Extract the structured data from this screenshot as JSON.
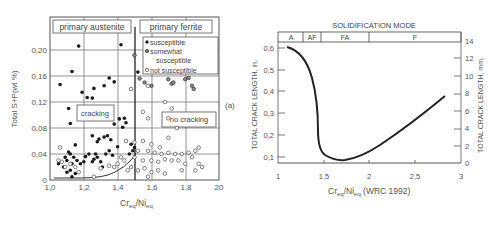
{
  "chart_data": [
    {
      "type": "scatter",
      "panel_label": "(a)",
      "title": "",
      "xlabel": "Cr_eq/Ni_eq",
      "ylabel": "Total S+P(wt %)",
      "xlim": [
        1.0,
        2.0
      ],
      "ylim": [
        0,
        0.24
      ],
      "x_ticks": [
        "1,0",
        "1,2",
        "1,4",
        "1,6",
        "1,8",
        "20"
      ],
      "y_ticks": [
        "0",
        "0,04",
        "0,08",
        "0,12",
        "0,16",
        "0,20"
      ],
      "grid": true,
      "regions": [
        {
          "label": "primary austenite"
        },
        {
          "label": "primary ferrite"
        },
        {
          "label": "cracking"
        },
        {
          "label": "no cracking"
        }
      ],
      "boundary_x": 1.5,
      "legend": {
        "position": "upper right",
        "entries": [
          "susceptible",
          "somewhat",
          "susceptible",
          "not susceptible"
        ]
      },
      "series": [
        {
          "name": "susceptible",
          "marker": "filled",
          "points": [
            [
              1.06,
              0.147
            ],
            [
              1.13,
              0.167
            ],
            [
              1.17,
              0.206
            ],
            [
              1.19,
              0.135
            ],
            [
              1.22,
              0.127
            ],
            [
              1.25,
              0.126
            ],
            [
              1.26,
              0.141
            ],
            [
              1.32,
              0.145
            ],
            [
              1.35,
              0.157
            ],
            [
              1.38,
              0.151
            ],
            [
              1.42,
              0.208
            ],
            [
              1.52,
              0.166
            ],
            [
              1.11,
              0.11
            ],
            [
              1.12,
              0.087
            ],
            [
              1.38,
              0.086
            ],
            [
              1.41,
              0.094
            ],
            [
              1.44,
              0.095
            ],
            [
              1.43,
              0.081
            ],
            [
              1.45,
              0.088
            ],
            [
              1.25,
              0.068
            ],
            [
              1.28,
              0.059
            ],
            [
              1.32,
              0.066
            ],
            [
              1.34,
              0.068
            ],
            [
              1.29,
              0.063
            ],
            [
              1.36,
              0.062
            ],
            [
              1.4,
              0.051
            ],
            [
              1.15,
              0.054
            ],
            [
              1.11,
              0.043
            ],
            [
              1.12,
              0.04
            ],
            [
              1.14,
              0.035
            ],
            [
              1.1,
              0.03
            ],
            [
              1.13,
              0.025
            ],
            [
              1.16,
              0.03
            ],
            [
              1.18,
              0.025
            ],
            [
              1.2,
              0.028
            ],
            [
              1.23,
              0.04
            ],
            [
              1.25,
              0.028
            ],
            [
              1.27,
              0.04
            ],
            [
              1.28,
              0.035
            ],
            [
              1.3,
              0.028
            ],
            [
              1.33,
              0.04
            ],
            [
              1.35,
              0.045
            ],
            [
              1.37,
              0.038
            ],
            [
              1.08,
              0.02
            ],
            [
              1.12,
              0.015
            ],
            [
              1.13,
              0.005
            ],
            [
              1.15,
              0.01
            ],
            [
              1.1,
              0.012
            ],
            [
              1.05,
              0.025
            ],
            [
              1.48,
              0.055
            ],
            [
              1.5,
              0.05
            ],
            [
              1.49,
              0.045
            ],
            [
              1.47,
              0.04
            ],
            [
              1.21,
              0.036
            ],
            [
              1.26,
              0.032
            ],
            [
              1.31,
              0.02
            ],
            [
              1.09,
              0.035
            ]
          ]
        },
        {
          "name": "somewhat susceptible",
          "marker": "half",
          "points": [
            [
              1.5,
              0.192
            ],
            [
              1.53,
              0.156
            ],
            [
              1.56,
              0.15
            ],
            [
              1.6,
              0.145
            ],
            [
              1.7,
              0.155
            ],
            [
              1.72,
              0.148
            ],
            [
              1.73,
              0.15
            ],
            [
              1.8,
              0.155
            ],
            [
              1.82,
              0.157
            ],
            [
              1.84,
              0.145
            ],
            [
              1.85,
              0.14
            ]
          ]
        },
        {
          "name": "not susceptible",
          "marker": "open",
          "points": [
            [
              1.48,
              0.14
            ],
            [
              1.58,
              0.145
            ],
            [
              1.68,
              0.12
            ],
            [
              1.72,
              0.11
            ],
            [
              1.55,
              0.105
            ],
            [
              1.58,
              0.095
            ],
            [
              1.7,
              0.095
            ],
            [
              1.75,
              0.08
            ],
            [
              1.7,
              0.065
            ],
            [
              1.45,
              0.06
            ],
            [
              1.5,
              0.058
            ],
            [
              1.55,
              0.06
            ],
            [
              1.6,
              0.055
            ],
            [
              1.65,
              0.05
            ],
            [
              1.52,
              0.045
            ],
            [
              1.58,
              0.045
            ],
            [
              1.62,
              0.042
            ],
            [
              1.66,
              0.04
            ],
            [
              1.7,
              0.042
            ],
            [
              1.74,
              0.04
            ],
            [
              1.78,
              0.04
            ],
            [
              1.82,
              0.042
            ],
            [
              1.86,
              0.045
            ],
            [
              1.88,
              0.05
            ],
            [
              1.5,
              0.035
            ],
            [
              1.55,
              0.03
            ],
            [
              1.6,
              0.03
            ],
            [
              1.64,
              0.028
            ],
            [
              1.68,
              0.032
            ],
            [
              1.72,
              0.03
            ],
            [
              1.76,
              0.03
            ],
            [
              1.8,
              0.025
            ],
            [
              1.84,
              0.035
            ],
            [
              1.88,
              0.025
            ],
            [
              1.9,
              0.02
            ],
            [
              1.48,
              0.02
            ],
            [
              1.52,
              0.015
            ],
            [
              1.56,
              0.018
            ],
            [
              1.6,
              0.012
            ],
            [
              1.64,
              0.015
            ],
            [
              1.68,
              0.01
            ],
            [
              1.78,
              0.015
            ],
            [
              1.86,
              0.015
            ],
            [
              1.44,
              0.03
            ],
            [
              1.4,
              0.025
            ],
            [
              1.38,
              0.02
            ],
            [
              1.35,
              0.022
            ],
            [
              1.3,
              0.018
            ],
            [
              1.06,
              0.05
            ],
            [
              1.05,
              0.03
            ],
            [
              1.07,
              0.028
            ],
            [
              1.09,
              0.02
            ],
            [
              1.12,
              0.025
            ],
            [
              1.15,
              0.02
            ],
            [
              1.17,
              0.012
            ],
            [
              1.26,
              0.005
            ],
            [
              1.46,
              0.015
            ],
            [
              1.42,
              0.035
            ],
            [
              1.58,
              0.005
            ]
          ]
        }
      ],
      "threshold_curve": [
        [
          1.02,
          0.005
        ],
        [
          1.2,
          0.006
        ],
        [
          1.3,
          0.01
        ],
        [
          1.4,
          0.02
        ],
        [
          1.46,
          0.03
        ],
        [
          1.5,
          0.04
        ]
      ]
    },
    {
      "type": "line",
      "title": "SOLIDIFICATION MODE",
      "xlabel": "Cr_eq/Ni_eq (WRC 1992)",
      "ylabel": "TOTAL CRACK LENGTH, in,",
      "y2label": "TOTAL CRACK LENGTH, mm,",
      "xlim": [
        1,
        3
      ],
      "ylim": [
        0.05,
        0.65
      ],
      "y2lim": [
        0,
        14
      ],
      "x_ticks": [
        "1",
        "1,5",
        "2",
        "2,5",
        "3"
      ],
      "y_ticks": [
        "0,1",
        "0,2",
        "0,3",
        "0,4",
        "0,5",
        "0,6"
      ],
      "y2_ticks": [
        "0",
        "2",
        "4",
        "6",
        "8",
        "10",
        "12",
        "14"
      ],
      "grid": false,
      "modes": [
        {
          "label": "A",
          "from": 1.0,
          "to": 1.28
        },
        {
          "label": "AF",
          "from": 1.28,
          "to": 1.48
        },
        {
          "label": "FA",
          "from": 1.48,
          "to": 2.05
        },
        {
          "label": "F",
          "from": 2.05,
          "to": 3.0
        }
      ],
      "series": [
        {
          "name": "crack length",
          "x": [
            1.1,
            1.2,
            1.3,
            1.38,
            1.43,
            1.45,
            1.46,
            1.5,
            1.6,
            1.7,
            1.8,
            2.0,
            2.2,
            2.4,
            2.6,
            2.82
          ],
          "values": [
            0.61,
            0.6,
            0.56,
            0.48,
            0.36,
            0.25,
            0.19,
            0.13,
            0.1,
            0.095,
            0.1,
            0.14,
            0.2,
            0.26,
            0.31,
            0.37
          ]
        }
      ]
    }
  ],
  "labels": {
    "left": {
      "region_austenite": "primary austenite",
      "region_ferrite": "primary ferrite",
      "cracking": "cracking",
      "no_cracking": "no cracking",
      "legend_1": "susceptible",
      "legend_2": "somewhat",
      "legend_3": "susceptible",
      "legend_4": "not susceptible",
      "panel": "(a)",
      "ylabel": "Total S+P(wt %)",
      "xlabel_main": "Cr",
      "xlabel_sub1": "eq",
      "xlabel_slash": "/Ni",
      "xlabel_sub2": "eq",
      "xticks": [
        "1,0",
        "1,2",
        "1,4",
        "1,6",
        "1,8",
        "20"
      ],
      "yticks": [
        "0",
        "0,04",
        "0,08",
        "0,12",
        "0,16",
        "0,20"
      ]
    },
    "right": {
      "title": "SOLIDIFICATION MODE",
      "mode_a": "A",
      "mode_af": "AF",
      "mode_fa": "FA",
      "mode_f": "F",
      "ylabel": "TOTAL CRACK LENGTH, in,",
      "y2label": "TOTAL CRACK LENGTH, mm,",
      "xlabel_main": "Cr",
      "xlabel_sub1": "eq",
      "xlabel_slash": "/Ni",
      "xlabel_sub2": "eq",
      "xlabel_rest": " (WRC 1992)",
      "xticks": [
        "1",
        "1,5",
        "2",
        "2,5",
        "3"
      ],
      "yticks": [
        "0,1",
        "0,2",
        "0,3",
        "0,4",
        "0,5",
        "0,6"
      ],
      "y2ticks": [
        "0",
        "2",
        "4",
        "6",
        "8",
        "10",
        "12",
        "14"
      ]
    }
  }
}
